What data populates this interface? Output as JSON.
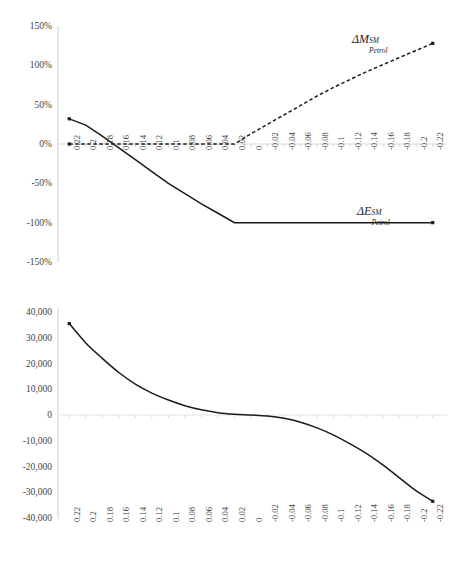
{
  "figure": {
    "background": "#ffffff",
    "line_color": "#1a1a1a",
    "axis_color": "#d9d9d9",
    "text_color": "#3f3f3f"
  },
  "chart_data": [
    {
      "type": "line",
      "id": "top-panel",
      "title": "",
      "xlabel": "",
      "ylabel": "",
      "grid": false,
      "legend_position": "inline-annotation",
      "xlim": [
        0.23,
        -0.23
      ],
      "ylim": [
        -1.5,
        1.5
      ],
      "x_reversed": true,
      "ytick_labels": [
        "150%",
        "100%",
        "50%",
        "0%",
        "-50%",
        "-100%",
        "-150%"
      ],
      "ytick_values": [
        1.5,
        1.0,
        0.5,
        0.0,
        -0.5,
        -1.0,
        -1.5
      ],
      "xtick_labels": [
        "0.22",
        "0.2",
        "0.18",
        "0.16",
        "0.14",
        "0.12",
        "0.1",
        "0.08",
        "0.06",
        "0.04",
        "0.02",
        "0",
        "-0.02",
        "-0.04",
        "-0.06",
        "-0.08",
        "-0.1",
        "-0.12",
        "-0.14",
        "-0.16",
        "-0.18",
        "-0.2",
        "-0.22"
      ],
      "x": [
        0.22,
        0.2,
        0.18,
        0.16,
        0.14,
        0.12,
        0.1,
        0.08,
        0.06,
        0.04,
        0.02,
        0,
        -0.02,
        -0.04,
        -0.06,
        -0.08,
        -0.1,
        -0.12,
        -0.14,
        -0.16,
        -0.18,
        -0.2,
        -0.22
      ],
      "series": [
        {
          "name": "ΔM_Petrol^SM",
          "label_base": "ΔM",
          "label_sup": "SM",
          "label_sub": "Petrol",
          "style": "dashed",
          "color": "#1a1a1a",
          "values": [
            0.0,
            0.0,
            0.0,
            0.0,
            0.0,
            0.0,
            0.0,
            0.0,
            0.0,
            0.0,
            0.0,
            0.13,
            0.25,
            0.37,
            0.49,
            0.61,
            0.72,
            0.82,
            0.92,
            1.01,
            1.1,
            1.19,
            1.28
          ]
        },
        {
          "name": "ΔE_Petrol^SM",
          "label_base": "ΔE",
          "label_sup": "SM",
          "label_sub": "Petrol",
          "style": "solid",
          "color": "#1a1a1a",
          "values": [
            0.32,
            0.24,
            0.1,
            -0.05,
            -0.2,
            -0.35,
            -0.5,
            -0.63,
            -0.76,
            -0.88,
            -1.0,
            -1.0,
            -1.0,
            -1.0,
            -1.0,
            -1.0,
            -1.0,
            -1.0,
            -1.0,
            -1.0,
            -1.0,
            -1.0,
            -1.0
          ]
        }
      ]
    },
    {
      "type": "line",
      "id": "bottom-panel",
      "title": "",
      "xlabel": "",
      "ylabel": "",
      "grid": false,
      "legend_position": "none",
      "xlim": [
        0.23,
        -0.23
      ],
      "ylim": [
        -40000,
        40000
      ],
      "x_reversed": true,
      "ytick_labels": [
        "40,000",
        "30,000",
        "20,000",
        "10,000",
        "0",
        "-10,000",
        "-20,000",
        "-30,000",
        "-40,000"
      ],
      "ytick_values": [
        40000,
        30000,
        20000,
        10000,
        0,
        -10000,
        -20000,
        -30000,
        -40000
      ],
      "xtick_labels": [
        "0.22",
        "0.2",
        "0.18",
        "0.16",
        "0.14",
        "0.12",
        "0.1",
        "0.08",
        "0.06",
        "0.04",
        "0.02",
        "0",
        "-0.02",
        "-0.04",
        "-0.06",
        "-0.08",
        "-0.1",
        "-0.12",
        "-0.14",
        "-0.16",
        "-0.18",
        "-0.2",
        "-0.22"
      ],
      "x": [
        0.22,
        0.2,
        0.18,
        0.16,
        0.14,
        0.12,
        0.1,
        0.08,
        0.06,
        0.04,
        0.02,
        0,
        -0.02,
        -0.04,
        -0.06,
        -0.08,
        -0.1,
        -0.12,
        -0.14,
        -0.16,
        -0.18,
        -0.2,
        -0.22
      ],
      "series": [
        {
          "name": "net-value",
          "style": "solid",
          "color": "#1a1a1a",
          "values": [
            35500,
            28000,
            22000,
            16500,
            12000,
            8500,
            5800,
            3600,
            2000,
            900,
            300,
            0,
            -400,
            -1300,
            -2800,
            -5000,
            -7800,
            -11200,
            -15000,
            -19500,
            -24500,
            -29500,
            -33500
          ]
        }
      ]
    }
  ]
}
